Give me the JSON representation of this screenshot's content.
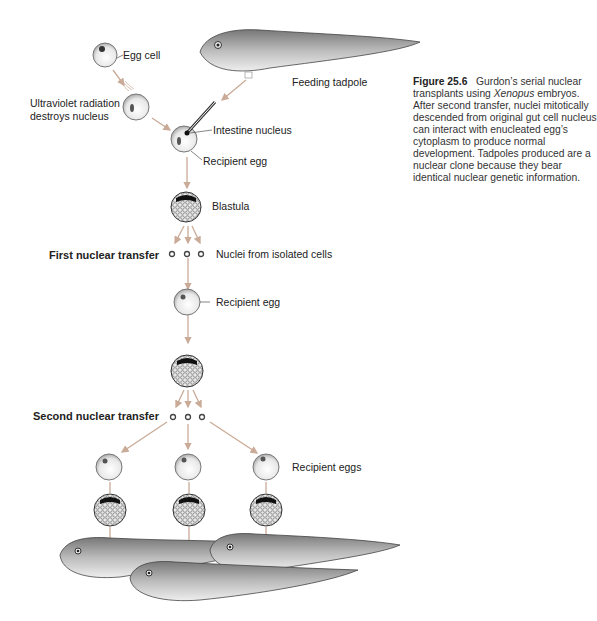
{
  "figure": {
    "number": "Figure 25.6",
    "caption_pre": "Gurdon’s serial nuclear transplants using ",
    "caption_italic": "Xenopus",
    "caption_post": " embryos. After second transfer, nuclei mitotically descended from original gut cell nucleus can interact with enucleated egg’s cytoplasm to produce normal development. Tadpoles produced are a nuclear clone because they bear identical nuclear genetic information."
  },
  "labels": {
    "egg_cell": "Egg cell",
    "uv_line1": "Ultraviolet radiation",
    "uv_line2": "destroys nucleus",
    "feeding_tadpole": "Feeding tadpole",
    "intestine_nucleus": "Intestine nucleus",
    "recipient_egg_1": "Recipient egg",
    "blastula": "Blastula",
    "first_transfer": "First nuclear transfer",
    "nuclei_isolated": "Nuclei from isolated cells",
    "recipient_egg_2": "Recipient egg",
    "second_transfer": "Second nuclear transfer",
    "recipient_eggs": "Recipient eggs"
  },
  "colors": {
    "arrow": "#c9ab97",
    "text": "#222222"
  }
}
